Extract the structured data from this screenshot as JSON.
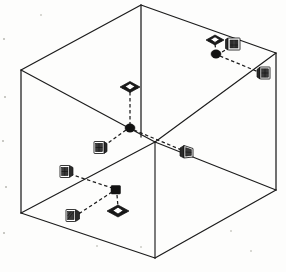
{
  "figure": {
    "style": "scanned black and white technical line art",
    "background_color": "#fdfdfc",
    "line_color": "#1c1c1c",
    "link_style": "dashed",
    "node_color": "#121212"
  },
  "room": {
    "name": "rectangular room",
    "projection": "isometric / two-point perspective open box",
    "vertices": {
      "top_apex": "141,5",
      "top_left": "21,70",
      "top_right": "276,53",
      "inner_corner_top": "155,142",
      "bottom_left": "21,213",
      "bottom_right": "276,190",
      "bottom_front": "155,258"
    },
    "faces": [
      {
        "id": "ceiling",
        "label": "ceiling plane"
      },
      {
        "id": "left-wall",
        "label": "left wall plane"
      },
      {
        "id": "right-wall",
        "label": "right wall plane"
      },
      {
        "id": "floor",
        "label": "floor plane"
      }
    ]
  },
  "hubs": [
    {
      "id": "hub-upper",
      "label": "upper hub node",
      "x": 216,
      "y": 54,
      "attached_to": "right wall upper region",
      "link_count": 3
    },
    {
      "id": "hub-lower",
      "label": "lower hub node",
      "x": 130,
      "y": 128,
      "attached_to": "room interior centre",
      "link_count": 3
    },
    {
      "id": "hub-floor",
      "label": "floor hub node",
      "x": 116,
      "y": 190,
      "attached_to": "floor plane",
      "link_count": 3
    }
  ],
  "devices": [
    {
      "id": "device-ceiling-upper-right",
      "label": "ceiling dome sensor (upper right)",
      "icon": "dome-sensor-icon",
      "type": "dome",
      "x": 215,
      "y": 40,
      "mount": "ceiling"
    },
    {
      "id": "device-wall-upper-right",
      "label": "wall panel sensor (upper right)",
      "icon": "wall-panel-icon",
      "type": "panel",
      "x": 234,
      "y": 44,
      "mount": "wall"
    },
    {
      "id": "device-wall-far-right",
      "label": "wall panel sensor (far right)",
      "icon": "wall-panel-icon",
      "type": "panel",
      "x": 265,
      "y": 73,
      "mount": "wall"
    },
    {
      "id": "device-ceiling-centre",
      "label": "ceiling dome sensor (centre)",
      "icon": "dome-sensor-icon",
      "type": "dome",
      "x": 130,
      "y": 87,
      "mount": "ceiling"
    },
    {
      "id": "device-wall-left-centre",
      "label": "wall panel sensor (left of centre)",
      "icon": "wall-panel-icon",
      "type": "panel",
      "x": 99,
      "y": 148,
      "mount": "wall"
    },
    {
      "id": "device-wall-right-centre",
      "label": "wall panel sensor (right of centre)",
      "icon": "wall-panel-icon",
      "type": "panel",
      "x": 188,
      "y": 152,
      "mount": "wall"
    },
    {
      "id": "device-wall-lower-left",
      "label": "wall panel sensor (lower left)",
      "icon": "wall-panel-icon",
      "type": "panel",
      "x": 65,
      "y": 172,
      "mount": "wall"
    },
    {
      "id": "device-floor-lower-left",
      "label": "floor panel sensor (lower left)",
      "icon": "wall-panel-icon",
      "type": "panel",
      "x": 71,
      "y": 216,
      "mount": "floor"
    },
    {
      "id": "device-floor-dome",
      "label": "floor dome sensor",
      "icon": "dome-sensor-icon",
      "type": "dome",
      "x": 118,
      "y": 211,
      "mount": "floor"
    }
  ],
  "links": [
    {
      "id": "link-1",
      "from": "device-ceiling-upper-right",
      "to": "hub-upper"
    },
    {
      "id": "link-2",
      "from": "device-wall-upper-right",
      "to": "hub-upper"
    },
    {
      "id": "link-3",
      "from": "hub-upper",
      "to": "device-wall-far-right"
    },
    {
      "id": "link-4",
      "from": "device-ceiling-centre",
      "to": "hub-lower"
    },
    {
      "id": "link-5",
      "from": "hub-lower",
      "to": "device-wall-left-centre"
    },
    {
      "id": "link-6",
      "from": "hub-lower",
      "to": "device-wall-right-centre"
    },
    {
      "id": "link-7",
      "from": "device-wall-lower-left",
      "to": "hub-floor"
    },
    {
      "id": "link-8",
      "from": "hub-floor",
      "to": "device-floor-lower-left"
    },
    {
      "id": "link-9",
      "from": "hub-floor",
      "to": "device-floor-dome"
    }
  ]
}
